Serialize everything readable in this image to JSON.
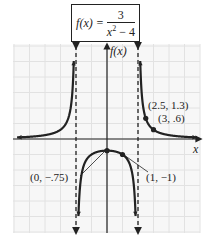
{
  "title": {
    "lhs": "f(x) =",
    "numerator": "3",
    "denominator_var": "x",
    "denominator_exp": "2",
    "denominator_rest": " − 4"
  },
  "axes": {
    "x_label": "x",
    "y_label": "f(x)"
  },
  "annotations": [
    {
      "text": "(2.5, 1.3)"
    },
    {
      "text": "(3, .6)"
    },
    {
      "text": "(0, −.75)"
    },
    {
      "text": "(1, −1)"
    }
  ],
  "colors": {
    "curve": "#222222",
    "grid": "#e6e6e6",
    "background": "#f7f7f7",
    "axis": "#222222"
  },
  "chart_data": {
    "type": "line",
    "function": "3/(x^2-4)",
    "xlabel": "x",
    "ylabel": "f(x)",
    "xlim": [
      -6,
      6
    ],
    "ylim": [
      -6,
      6
    ],
    "grid": true,
    "vertical_asymptotes": [
      -2,
      2
    ],
    "horizontal_asymptote": 0,
    "labeled_points": [
      {
        "x": 2.5,
        "y": 1.3,
        "label": "(2.5, 1.3)"
      },
      {
        "x": 3,
        "y": 0.6,
        "label": "(3, .6)"
      },
      {
        "x": 0,
        "y": -0.75,
        "label": "(0, −.75)"
      },
      {
        "x": 1,
        "y": -1,
        "label": "(1, −1)"
      }
    ],
    "series": [
      {
        "name": "left branch",
        "x_range": [
          -5.8,
          -2.1
        ]
      },
      {
        "name": "middle branch",
        "x_range": [
          -1.85,
          1.85
        ]
      },
      {
        "name": "right branch",
        "x_range": [
          2.1,
          5.8
        ]
      }
    ]
  }
}
